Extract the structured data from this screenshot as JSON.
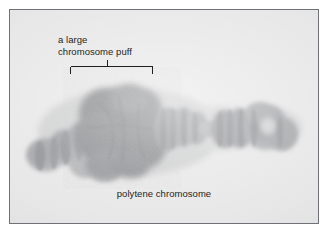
{
  "figure": {
    "kind": "light-micrograph",
    "subject": "polytene chromosome",
    "plate": {
      "background_color": "#e4e4e4",
      "border_color": "#6e7276",
      "outer_margin_color": "#ffffff"
    }
  },
  "annotations": {
    "puff_callout": {
      "line1": "a large",
      "line2": "chromosome puff",
      "bracket": {
        "style": "square-bracket-with-center-stem",
        "points_to": "large chromosome puff"
      }
    },
    "caption": {
      "text": "polytene chromosome"
    }
  },
  "specimen": {
    "name": "polytene chromosome",
    "stain_color_dark": "#6f7074",
    "stain_color_mid": "#8e8f92",
    "stain_color_light": "#b4b5b7",
    "regions": [
      {
        "name": "left-arm-tip",
        "description": "rounded banded terminal lobe"
      },
      {
        "name": "left-arm-bands",
        "description": "series of transverse bands"
      },
      {
        "name": "chromosome-puff",
        "description": "large diffuse darkly stained decondensed swelling"
      },
      {
        "name": "mid-banded-segment",
        "description": "compact banded region right of the puff"
      },
      {
        "name": "constriction",
        "description": "narrow thinned connector"
      },
      {
        "name": "right-banded-segment",
        "description": "banded region after the constriction"
      },
      {
        "name": "right-arm-tip",
        "description": "terminal rounded lobe with pale core"
      }
    ]
  }
}
